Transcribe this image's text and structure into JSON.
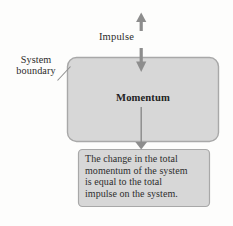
{
  "diagram": {
    "colors": {
      "box_fill": "#d7d7d7",
      "box_stroke": "#a8a8a8",
      "arrow": "#8d8d8d",
      "text": "#2b2b2b",
      "background": "#fdfdfc"
    },
    "arrows": [
      {
        "name": "impulse-arrow-up",
        "direction": "up"
      },
      {
        "name": "impulse-arrow-down",
        "direction": "down"
      },
      {
        "name": "momentum-to-statement-arrow",
        "direction": "down"
      }
    ],
    "impulse_label": "Impulse",
    "boundary_label": {
      "line1": "System",
      "line2": "boundary"
    },
    "system_box_label": "Momentum",
    "statement": {
      "line1": "The change in the total",
      "line2": "momentum of the system",
      "line3": "is equal to the total",
      "line4": "impulse on the system."
    }
  }
}
